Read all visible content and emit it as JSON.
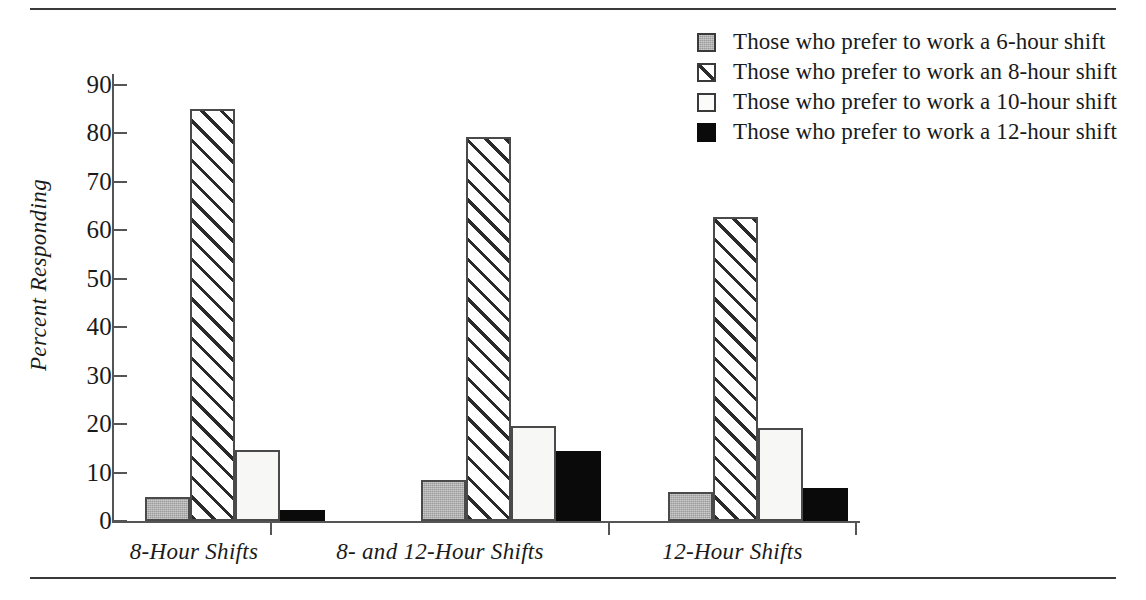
{
  "chart_data": {
    "type": "bar",
    "title": "",
    "subtitle": "",
    "xlabel": "",
    "ylabel": "Percent Responding",
    "ylim": [
      0,
      90
    ],
    "ytick_step": 10,
    "yticks": [
      0,
      10,
      20,
      30,
      40,
      50,
      60,
      70,
      80,
      90
    ],
    "ytick_labels": [
      "0",
      "10",
      "20",
      "30",
      "40",
      "50",
      "60",
      "70",
      "80",
      "90"
    ],
    "grid": false,
    "legend_position": "top-right",
    "categories": [
      "8-Hour Shifts",
      "8- and 12-Hour Shifts",
      "12-Hour Shifts"
    ],
    "series": [
      {
        "name": "Those who prefer to work a 6-hour shift",
        "pattern": "gray",
        "color": "#9b9b9b",
        "values": [
          5.0,
          8.5,
          6.0
        ]
      },
      {
        "name": "Those who prefer to work an 8-hour shift",
        "pattern": "hatch",
        "color": "#ffffff",
        "values": [
          85.0,
          79.3,
          62.7
        ]
      },
      {
        "name": "Those who prefer to work a 10-hour shift",
        "pattern": "white",
        "color": "#f7f7f5",
        "values": [
          14.7,
          19.6,
          19.3
        ]
      },
      {
        "name": "Those who prefer to work a 12-hour shift",
        "pattern": "black",
        "color": "#0a0a0a",
        "values": [
          2.3,
          14.5,
          6.8
        ]
      }
    ]
  },
  "legend": {
    "items": [
      {
        "label": "Those who prefer to work a 6-hour shift",
        "pattern": "gray"
      },
      {
        "label": "Those who prefer to work an 8-hour shift",
        "pattern": "hatch"
      },
      {
        "label": "Those who prefer to work a 10-hour shift",
        "pattern": "white"
      },
      {
        "label": "Those who prefer to work a 12-hour shift",
        "pattern": "black"
      }
    ]
  },
  "axes": {
    "y_title": "Percent Responding",
    "x_categories": [
      "8-Hour Shifts",
      "8- and 12-Hour Shifts",
      "12-Hour Shifts"
    ]
  },
  "colors": {
    "axis": "#555555",
    "rule": "#3a3a3a",
    "text": "#1a1a1a",
    "bar_border": "#4a4a4a",
    "gray_fill": "#9b9b9b",
    "black_fill": "#0a0a0a",
    "white_fill": "#f7f7f5",
    "hatch_line": "#2b2b2b"
  }
}
